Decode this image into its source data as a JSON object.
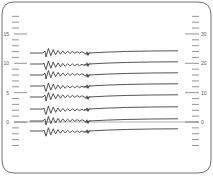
{
  "figure": {
    "type": "waveform-diagram",
    "colors": {
      "frame": "#6e6e6e",
      "tick": "#7a7a7a",
      "trace": "#2a2a2a",
      "label": "#555555",
      "background": "#ffffff"
    }
  },
  "left_scale": {
    "labels": [
      {
        "value": "15",
        "y": 34
      },
      {
        "value": "10",
        "y": 63
      },
      {
        "value": "5",
        "y": 93
      },
      {
        "value": "0",
        "y": 122
      }
    ],
    "min": -4,
    "max": 18,
    "unit_px": 5.87,
    "zero_y": 122
  },
  "right_scale": {
    "labels": [
      {
        "value": "30",
        "y": 34
      },
      {
        "value": "20",
        "y": 63
      },
      {
        "value": "10",
        "y": 93
      },
      {
        "value": "0",
        "y": 122
      }
    ],
    "min": -8,
    "max": 36,
    "unit_px": 2.935,
    "zero_y": 122
  },
  "traces": [
    {
      "baseline_y": 53,
      "step": -2
    },
    {
      "baseline_y": 64,
      "step": 3
    },
    {
      "baseline_y": 75,
      "step": -2
    },
    {
      "baseline_y": 86,
      "step": 3
    },
    {
      "baseline_y": 97,
      "step": -2
    },
    {
      "baseline_y": 109,
      "step": 3
    },
    {
      "baseline_y": 121,
      "step": -2
    },
    {
      "baseline_y": 131,
      "step": 2
    }
  ]
}
